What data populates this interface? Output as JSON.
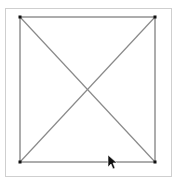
{
  "canvas": {
    "width": 179,
    "height": 183,
    "background": "#ffffff",
    "frame": {
      "x": 5,
      "y": 8,
      "width": 166,
      "height": 168,
      "stroke": "#cfcfcf"
    },
    "square": {
      "corners": [
        [
          20,
          17
        ],
        [
          155,
          17
        ],
        [
          155,
          162
        ],
        [
          20,
          162
        ]
      ],
      "stroke": "#5a5a5a"
    },
    "diagonals": [
      {
        "from": [
          20,
          17
        ],
        "to": [
          155,
          162
        ],
        "stroke": "#8a8a8a"
      },
      {
        "from": [
          155,
          17
        ],
        "to": [
          20,
          162
        ],
        "stroke": "#8a8a8a"
      }
    ],
    "vertex_color": "#111111",
    "cursor": {
      "x": 108,
      "y": 155
    }
  }
}
